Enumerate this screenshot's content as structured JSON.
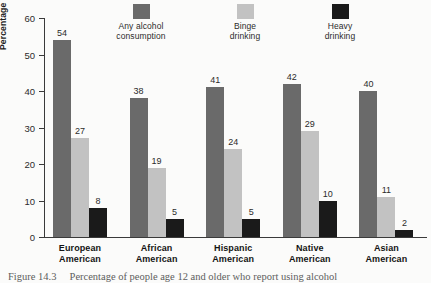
{
  "chart_data": {
    "type": "bar",
    "title": "",
    "xlabel": "",
    "ylabel": "Percentage engaging in behavior",
    "ylim": [
      0,
      60
    ],
    "yticks": [
      "0",
      "10",
      "20",
      "30",
      "40",
      "50",
      "60"
    ],
    "grid": false,
    "legend_position": "top",
    "categories": [
      "European American",
      "African American",
      "Hispanic American",
      "Native American",
      "Asian American"
    ],
    "category_lines": [
      [
        "European",
        "American"
      ],
      [
        "African",
        "American"
      ],
      [
        "Hispanic",
        "American"
      ],
      [
        "Native",
        "American"
      ],
      [
        "Asian",
        "American"
      ]
    ],
    "series": [
      {
        "name": "Any alcohol consumption",
        "name_lines": [
          "Any alcohol",
          "consumption"
        ],
        "color": "#6a6a6a",
        "values": [
          54,
          38,
          41,
          42,
          40
        ]
      },
      {
        "name": "Binge drinking",
        "name_lines": [
          "Binge",
          "drinking"
        ],
        "color": "#c2c2c2",
        "values": [
          27,
          19,
          24,
          29,
          11
        ]
      },
      {
        "name": "Heavy drinking",
        "name_lines": [
          "Heavy",
          "drinking"
        ],
        "color": "#1a1a1a",
        "values": [
          8,
          5,
          5,
          10,
          2
        ]
      }
    ]
  },
  "caption": {
    "figure_number": "Figure 14.3",
    "text": "Percentage of people age 12 and older who report using alcohol"
  }
}
